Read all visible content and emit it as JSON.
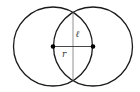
{
  "diagram": {
    "colors": {
      "stroke": "#1a1a1a",
      "thin_line": "#777777",
      "point": "#000000",
      "label": "#333333"
    },
    "circles": [
      {
        "name": "left-circle",
        "cx": 53,
        "cy": 46.5,
        "r": 39.5
      },
      {
        "name": "right-circle",
        "cx": 93,
        "cy": 46.5,
        "r": 39.5
      }
    ],
    "points": [
      {
        "name": "left-center",
        "x": 53,
        "y": 46.5
      },
      {
        "name": "right-center",
        "x": 93,
        "y": 46.5
      }
    ],
    "segments": [
      {
        "name": "radius-segment",
        "x1": 53,
        "y1": 46.5,
        "x2": 93,
        "y2": 46.5
      },
      {
        "name": "chord-segment",
        "x1": 73,
        "y1": 12,
        "x2": 73,
        "y2": 81
      }
    ],
    "labels": {
      "radius": "r",
      "chord": "ℓ"
    }
  }
}
